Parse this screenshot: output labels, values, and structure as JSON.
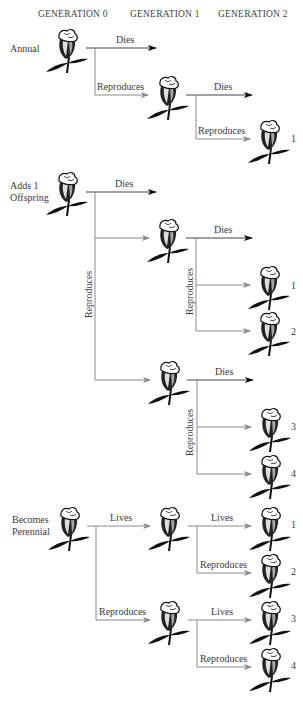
{
  "headers": [
    "GENERATION 0",
    "GENERATION 1",
    "GENERATION 2"
  ],
  "sections": [
    {
      "label_lines": [
        "Annual"
      ],
      "edges": [
        "Dies",
        "Reproduces",
        "Dies",
        "Reproduces"
      ],
      "offspring_numbers": [
        "1"
      ]
    },
    {
      "label_lines": [
        "Adds 1",
        "Offspring"
      ],
      "edges": [
        "Dies",
        "Reproduces",
        "Dies",
        "Reproduces",
        "Dies",
        "Reproduces"
      ],
      "offspring_numbers": [
        "1",
        "2",
        "3",
        "4"
      ]
    },
    {
      "label_lines": [
        "Becomes",
        "Perennial"
      ],
      "edges": [
        "Lives",
        "Reproduces",
        "Lives",
        "Reproduces",
        "Lives",
        "Reproduces"
      ],
      "offspring_numbers": [
        "1",
        "2",
        "3",
        "4"
      ]
    }
  ],
  "colors": {
    "arrow_gray": "#8a8a8a",
    "arrow_black": "#111111",
    "text": "#3a3a3a"
  },
  "icons": {
    "plant": "flower-icon"
  }
}
